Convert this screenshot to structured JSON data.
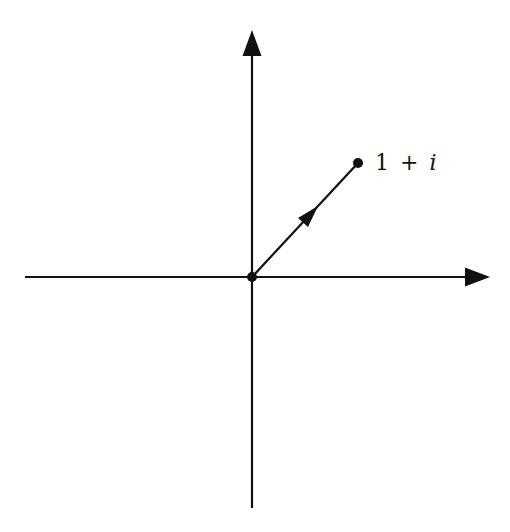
{
  "diagram": {
    "colors": {
      "stroke": "#111111",
      "background": "#ffffff"
    },
    "axes": {
      "origin": {
        "x": 252,
        "y": 277
      },
      "horizontal": {
        "x_start": 25,
        "x_end": 490
      },
      "vertical": {
        "y_start": 508,
        "y_end": 30
      }
    },
    "point": {
      "x": 358,
      "y": 163,
      "label_parts": {
        "a": "1",
        "op": "+",
        "b": "i"
      }
    },
    "vector": {
      "from": "origin",
      "to": "point",
      "mid_arrow": true
    }
  }
}
